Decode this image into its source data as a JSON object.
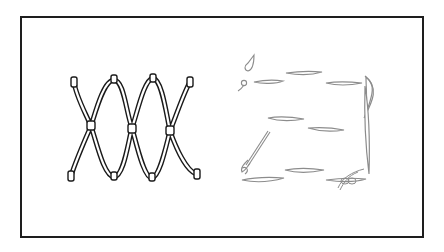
{
  "figure": {
    "title": "Knotted cord net and faded stitched outline illustration",
    "colors": {
      "frame": "#1e1e1e",
      "left_cord_stroke": "#1a1a1a",
      "left_cord_fill": "#ffffff",
      "right_stitch_stroke": "#8c8c8c",
      "background": "#ffffff"
    },
    "panels": [
      {
        "id": "left",
        "description": "Two intertwined wavy cords knotted at three crossing points forming a net pattern"
      },
      {
        "id": "right",
        "description": "Faded dashed running-stitch rectangle outline with a needle, thread and tangled knot"
      }
    ]
  }
}
